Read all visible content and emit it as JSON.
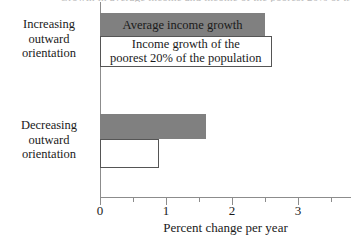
{
  "figure": {
    "top_cut_caption": "Growth in average income and income of the poorest 20% of the population",
    "axis_title": "Percent change per year"
  },
  "chart_data": {
    "type": "bar",
    "orientation": "horizontal",
    "title": "",
    "xlabel": "Percent change per year",
    "ylabel": "",
    "xlim": [
      0,
      3.8
    ],
    "xticks": [
      0,
      1,
      2,
      3
    ],
    "xtick_labels": [
      "0",
      "1",
      "2",
      "3"
    ],
    "minor_xticks": [
      0.5,
      1.5,
      2.5,
      3.5
    ],
    "grid": false,
    "legend": "inline bar labels",
    "categories": [
      "Increasing outward orientation",
      "Decreasing outward orientation"
    ],
    "series": [
      {
        "name": "Average income growth",
        "color": "#808080",
        "style": "solid-gray",
        "values": [
          2.5,
          1.6
        ]
      },
      {
        "name": "Income growth of the poorest 20% of the population",
        "color": "#ffffff",
        "style": "hollow-outline",
        "values": [
          2.6,
          0.9
        ]
      }
    ],
    "bar_labels": [
      "Average income growth",
      "Income growth of the\npoorest 20% of the population"
    ]
  },
  "axis": {
    "ticks": [
      {
        "value": "0",
        "kind": "major"
      },
      {
        "value": "0.5",
        "kind": "minor"
      },
      {
        "value": "1",
        "kind": "major"
      },
      {
        "value": "1.5",
        "kind": "minor"
      },
      {
        "value": "2",
        "kind": "major"
      },
      {
        "value": "2.5",
        "kind": "minor"
      },
      {
        "value": "3",
        "kind": "major"
      },
      {
        "value": "3.5",
        "kind": "minor"
      }
    ]
  },
  "bar_label_lines": {
    "avg_growth": "Average income growth",
    "poorest_line1": "Income growth of the",
    "poorest_line2": "poorest 20% of the population"
  },
  "category_labels": {
    "group1_line1": "Increasing",
    "group1_line2": "outward",
    "group1_line3": "orientation",
    "group2_line1": "Decreasing",
    "group2_line2": "outward",
    "group2_line3": "orientation"
  }
}
